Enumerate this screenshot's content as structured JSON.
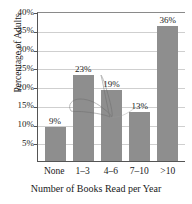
{
  "chart_data": {
    "type": "bar",
    "title": "",
    "xlabel": "Number of Books Read per Year",
    "ylabel": "Percentage of Adults",
    "categories": [
      "None",
      "1–3",
      "4–6",
      "7–10",
      ">10"
    ],
    "values": [
      9,
      23,
      19,
      13,
      36
    ],
    "data_labels": [
      "9%",
      "23%",
      "19%",
      "13%",
      "36%"
    ],
    "ylim": [
      0,
      40
    ],
    "ytick_values": [
      5,
      10,
      15,
      20,
      25,
      30,
      35,
      40
    ],
    "ytick_labels": [
      "5%",
      "10%",
      "15%",
      "20%",
      "25%",
      "30%",
      "35%",
      "40%"
    ],
    "grid": true,
    "legend": null,
    "bar_color": "#8e8e8e",
    "axis_color": "#555555",
    "grid_color": "#cfcfcf",
    "annotations": [
      {
        "name": "pen-scribble",
        "description": "faint hand-drawn loop over the 16%–23% region"
      }
    ]
  }
}
